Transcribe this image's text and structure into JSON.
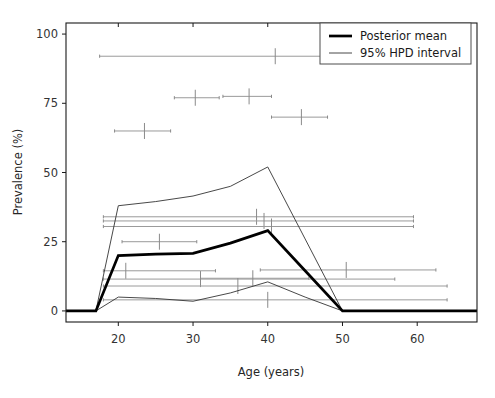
{
  "chart_data": {
    "type": "line",
    "title": "",
    "subtitle": "",
    "xlabel": "Age (years)",
    "ylabel": "Prevalence (%)",
    "xlim": [
      13,
      68
    ],
    "ylim": [
      -4,
      104
    ],
    "xticks": [
      20,
      30,
      40,
      50,
      60
    ],
    "yticks": [
      0,
      25,
      50,
      75,
      100
    ],
    "xtick_labels": [
      "20",
      "30",
      "40",
      "50",
      "60"
    ],
    "ytick_labels": [
      "0",
      "25",
      "50",
      "75",
      "100"
    ],
    "grid": false,
    "legend_position": "upper right",
    "legend": [
      {
        "label": "Posterior mean",
        "style": "thick-line",
        "color": "#000000",
        "width": 2.6
      },
      {
        "label": "95% HPD interval",
        "style": "thin-line",
        "color": "#333333",
        "width": 0.8
      }
    ],
    "series": [
      {
        "name": "Posterior mean",
        "style": "thick-line",
        "color": "#000000",
        "x": [
          13,
          15,
          17,
          20,
          25,
          30,
          35,
          40,
          45,
          50,
          55,
          60,
          68
        ],
        "values": [
          0,
          0,
          0,
          20,
          20.5,
          20.8,
          24.5,
          29,
          14.5,
          0,
          0,
          0,
          0
        ]
      },
      {
        "name": "95% HPD upper",
        "style": "thin-line",
        "color": "#333333",
        "x": [
          13,
          15,
          17,
          20,
          25,
          30,
          35,
          40,
          45,
          50,
          55,
          60,
          68
        ],
        "values": [
          0,
          0,
          0,
          38,
          39.5,
          41.5,
          45,
          52,
          26,
          0,
          0,
          0,
          0
        ]
      },
      {
        "name": "95% HPD lower",
        "style": "thin-line",
        "color": "#333333",
        "x": [
          13,
          15,
          17,
          20,
          25,
          30,
          35,
          40,
          45,
          50,
          55,
          60,
          68
        ],
        "values": [
          0,
          0,
          0,
          5,
          4.5,
          3.5,
          6.5,
          10.5,
          5,
          0,
          0,
          0,
          0
        ]
      }
    ],
    "observed_intervals": [
      {
        "y": 92.0,
        "x_lo": 17.5,
        "x_hi": 53.0,
        "x_center": 41.0
      },
      {
        "y": 77.0,
        "x_lo": 27.5,
        "x_hi": 33.5,
        "x_center": 30.3
      },
      {
        "y": 77.5,
        "x_lo": 34.0,
        "x_hi": 40.5,
        "x_center": 37.5
      },
      {
        "y": 70.0,
        "x_lo": 40.5,
        "x_hi": 48.0,
        "x_center": 44.5
      },
      {
        "y": 65.0,
        "x_lo": 19.5,
        "x_hi": 27.0,
        "x_center": 23.5
      },
      {
        "y": 34.0,
        "x_lo": 18.0,
        "x_hi": 59.5,
        "x_center": 38.5
      },
      {
        "y": 32.5,
        "x_lo": 18.0,
        "x_hi": 59.5,
        "x_center": 39.5
      },
      {
        "y": 30.5,
        "x_lo": 18.0,
        "x_hi": 59.5,
        "x_center": 40.5
      },
      {
        "y": 25.0,
        "x_lo": 20.5,
        "x_hi": 30.5,
        "x_center": 25.5
      },
      {
        "y": 14.5,
        "x_lo": 18.0,
        "x_hi": 33.0,
        "x_center": 21.0
      },
      {
        "y": 14.8,
        "x_lo": 39.0,
        "x_hi": 62.5,
        "x_center": 50.5
      },
      {
        "y": 11.5,
        "x_lo": 18.0,
        "x_hi": 57.0,
        "x_center": 31.0
      },
      {
        "y": 11.8,
        "x_lo": 31.0,
        "x_hi": 45.5,
        "x_center": 38.0
      },
      {
        "y": 9.0,
        "x_lo": 18.0,
        "x_hi": 64.0,
        "x_center": 36.0
      },
      {
        "y": 4.0,
        "x_lo": 18.0,
        "x_hi": 64.0,
        "x_center": 40.0
      }
    ]
  },
  "axes": {
    "ylabel": "Prevalence (%)",
    "xlabel": "Age (years)"
  },
  "legend": {
    "items": [
      {
        "label": "Posterior mean"
      },
      {
        "label": "95% HPD interval"
      }
    ]
  }
}
